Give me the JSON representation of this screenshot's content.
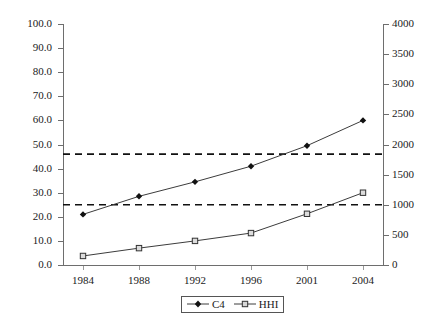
{
  "chart_data": {
    "type": "line",
    "title": "",
    "subtitle": "",
    "xlabel": "",
    "ylabel": "",
    "y2label": "",
    "grid": false,
    "legend_position": "bottom",
    "categories": [
      "1984",
      "1988",
      "1992",
      "1996",
      "2001",
      "2004"
    ],
    "series": [
      {
        "name": "C4",
        "axis": "left",
        "marker": "diamond",
        "values": [
          21.0,
          28.5,
          34.5,
          41.0,
          49.5,
          60.0
        ]
      },
      {
        "name": "HHI",
        "axis": "right",
        "marker": "square",
        "values": [
          150,
          280,
          400,
          530,
          850,
          1200
        ]
      }
    ],
    "ylim": [
      0.0,
      100.0
    ],
    "y2lim": [
      0,
      4000
    ],
    "yticks": [
      "0.0",
      "10.0",
      "20.0",
      "30.0",
      "40.0",
      "50.0",
      "60.0",
      "70.0",
      "80.0",
      "90.0",
      "100.0"
    ],
    "ytick_values": [
      0,
      10,
      20,
      30,
      40,
      50,
      60,
      70,
      80,
      90,
      100
    ],
    "y2ticks": [
      "0",
      "500",
      "1000",
      "1500",
      "2000",
      "2500",
      "3000",
      "3500",
      "4000"
    ],
    "y2tick_values": [
      0,
      500,
      1000,
      1500,
      2000,
      2500,
      3000,
      3500,
      4000
    ],
    "reference_lines": [
      {
        "name": "c4-threshold",
        "axis": "left",
        "value": 46.0,
        "style": "dashed"
      },
      {
        "name": "hhi-threshold",
        "axis": "left",
        "value": 25.0,
        "style": "dashed"
      }
    ],
    "colors": {
      "series_line": "#3c3c3c",
      "axis": "#6e6e6e",
      "reference_line": "#111111",
      "text": "#1a1a1a"
    }
  },
  "legend": {
    "entries": [
      {
        "label": "C4",
        "marker": "diamond"
      },
      {
        "label": "HHI",
        "marker": "square"
      }
    ]
  }
}
